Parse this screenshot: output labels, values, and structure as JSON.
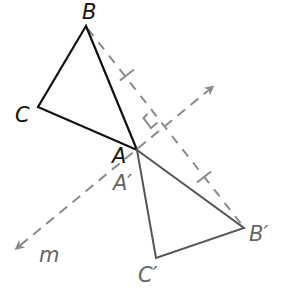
{
  "diagram": {
    "type": "reflection",
    "colors": {
      "original": "#111111",
      "image": "#555555",
      "construction": "#8a8a8a",
      "image_label": "#666666"
    },
    "original_triangle": {
      "vertices": {
        "A": {
          "label": "A",
          "x": 137,
          "y": 150
        },
        "B": {
          "label": "B",
          "x": 86,
          "y": 26
        },
        "C": {
          "label": "C",
          "x": 38,
          "y": 107
        }
      }
    },
    "image_triangle": {
      "vertices": {
        "A_prime": {
          "label": "A′",
          "x": 137,
          "y": 150
        },
        "B_prime": {
          "label": "B′",
          "x": 244,
          "y": 228
        },
        "C_prime": {
          "label": "C′",
          "x": 156,
          "y": 258
        }
      }
    },
    "line_of_reflection": {
      "label": "m",
      "from": {
        "x": 17,
        "y": 248
      },
      "to": {
        "x": 216,
        "y": 84
      },
      "style": "dashed, arrows both ends"
    },
    "segment_BB_prime": {
      "style": "dashed",
      "congruent_tick_marks": 2,
      "right_angle_marker": true
    },
    "labels": {
      "A": "A",
      "B": "B",
      "C": "C",
      "A_prime": "A′",
      "B_prime": "B′",
      "C_prime": "C′",
      "m": "m"
    }
  }
}
